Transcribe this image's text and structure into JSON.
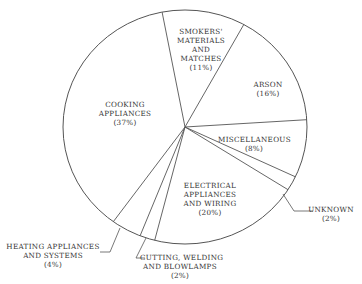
{
  "chart_data": {
    "type": "pie",
    "title": "",
    "start_angle_deg": -10.8,
    "direction": "clockwise",
    "center": [
      185,
      127
    ],
    "radius_x": 122,
    "radius_y": 117,
    "categories": [
      "SMOKERS' MATERIALS AND MATCHES",
      "ARSON",
      "MISCELLANEOUS",
      "UNKNOWN",
      "ELECTRICAL APPLIANCES AND WIRING",
      "CUTTING, WELDING AND BLOWLAMPS",
      "HEATING APPLIANCES AND SYSTEMS",
      "COOKING APPLIANCES"
    ],
    "values": [
      11,
      16,
      8,
      2,
      20,
      2,
      4,
      37
    ],
    "legend": "none (labels placed on/near slices)",
    "fill": "none",
    "stroke": "#555555"
  },
  "labels": {
    "smokers": {
      "lines": [
        "SMOKERS'",
        "MATERIALS",
        "AND",
        "MATCHES"
      ],
      "pct": "(11%)"
    },
    "arson": {
      "lines": [
        "ARSON"
      ],
      "pct": "(16%)"
    },
    "misc": {
      "lines": [
        "MISCELLANEOUS"
      ],
      "pct": "(8%)"
    },
    "unknown": {
      "lines": [
        "UNKNOWN"
      ],
      "pct": "(2%)"
    },
    "electrical": {
      "lines": [
        "ELECTRICAL",
        "APPLIANCES",
        "AND WIRING"
      ],
      "pct": "(20%)"
    },
    "cutting": {
      "lines": [
        "CUTTING, WELDING",
        "AND BLOWLAMPS"
      ],
      "pct": "(2%)"
    },
    "heating": {
      "lines": [
        "HEATING APPLIANCES",
        "AND SYSTEMS"
      ],
      "pct": "(4%)"
    },
    "cooking": {
      "lines": [
        "COOKING",
        "APPLIANCES"
      ],
      "pct": "(37%)"
    }
  }
}
